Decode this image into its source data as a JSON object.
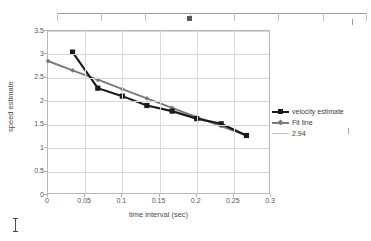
{
  "ruler": {
    "tab_marker_name": "tab-stop-marker",
    "tick_count": 8
  },
  "chart_data": {
    "type": "line",
    "title": "",
    "xlabel": "time interval (sec)",
    "ylabel": "speed estimate",
    "xlim": [
      0,
      0.3
    ],
    "ylim": [
      0,
      3.5
    ],
    "xticks": [
      0,
      0.05,
      0.1,
      0.15,
      0.2,
      0.25,
      0.3
    ],
    "xtick_labels": [
      "0",
      "0.05",
      "0.1",
      "0.15",
      "0.2",
      "0.25",
      "0.3"
    ],
    "yticks": [
      0,
      0.5,
      1,
      1.5,
      2,
      2.5,
      3,
      3.5
    ],
    "ytick_labels": [
      "0",
      "0.5",
      "1",
      "1.5",
      "2",
      "2.5",
      "3",
      "3.5"
    ],
    "grid": "horizontal-and-vertical",
    "legend_position": "right",
    "series": [
      {
        "name": "velocity estimate",
        "color": "#1a1a1a",
        "marker": "square",
        "x": [
          0.033,
          0.067,
          0.1,
          0.133,
          0.167,
          0.2,
          0.233,
          0.267
        ],
        "y": [
          3.05,
          2.28,
          2.11,
          1.91,
          1.79,
          1.63,
          1.52,
          1.27
        ]
      },
      {
        "name": "Fit line",
        "color": "#7a7a7a",
        "marker": "diamond",
        "x": [
          0.0,
          0.033,
          0.067,
          0.1,
          0.133,
          0.167,
          0.2,
          0.233,
          0.267
        ],
        "y": [
          2.86,
          2.66,
          2.46,
          2.26,
          2.06,
          1.86,
          1.66,
          1.47,
          1.27
        ]
      },
      {
        "name": "2.94",
        "color": "#c0c0c0",
        "marker": "none",
        "x": [],
        "y": []
      }
    ]
  }
}
